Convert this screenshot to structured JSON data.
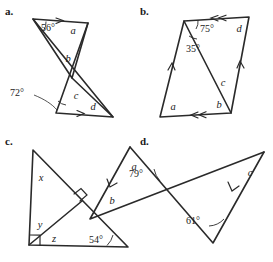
{
  "page": {
    "width": 273,
    "height": 262,
    "background": "#ffffff",
    "ink_color": "#2a2a2a",
    "text_color": "#1a1a1a"
  },
  "figures": [
    {
      "key": "a",
      "label": "a.",
      "description": "Bowtie of two triangles sharing a vertex, with parallel top and bottom segments marked by single arrowheads.",
      "angle_labels": [
        "56°",
        "72°"
      ],
      "variable_labels": [
        "a",
        "b",
        "c",
        "d"
      ],
      "parallel_marks": 2
    },
    {
      "key": "b",
      "label": "b.",
      "description": "Parallelogram with a diagonal drawn; top and bottom sides marked with double arrowheads, left and right sides with single arrowheads.",
      "angle_labels": [
        "75°",
        "35°"
      ],
      "variable_labels": [
        "a",
        "b",
        "c",
        "d"
      ],
      "parallel_marks": 4
    },
    {
      "key": "c",
      "label": "c.",
      "description": "Right triangle with the right angle at the lower-left vertex and an altitude drawn to the hypotenuse forming a second right angle.",
      "angle_labels": [
        "54°"
      ],
      "variable_labels": [
        "x",
        "y",
        "z"
      ],
      "right_angle_marks": 2
    },
    {
      "key": "d",
      "label": "d.",
      "description": "Two triangles crossing in an X, with single arrowheads marking two parallel sides.",
      "angle_labels": [
        "79°",
        "61°"
      ],
      "variable_labels": [
        "a",
        "b",
        "c"
      ],
      "parallel_marks": 2
    }
  ],
  "fig_a": {
    "label": "a.",
    "angle_56": "56°",
    "angle_72": "72°",
    "var_a": "a",
    "var_b": "b",
    "var_c": "c",
    "var_d": "d"
  },
  "fig_b": {
    "label": "b.",
    "angle_75": "75°",
    "angle_35": "35°",
    "var_a": "a",
    "var_b": "b",
    "var_c": "c",
    "var_d": "d"
  },
  "fig_c": {
    "label": "c.",
    "angle_54": "54°",
    "var_x": "x",
    "var_y": "y",
    "var_z": "z"
  },
  "fig_d": {
    "label": "d.",
    "angle_79": "79°",
    "angle_61": "61°",
    "var_a": "a",
    "var_b": "b",
    "var_c": "c"
  }
}
